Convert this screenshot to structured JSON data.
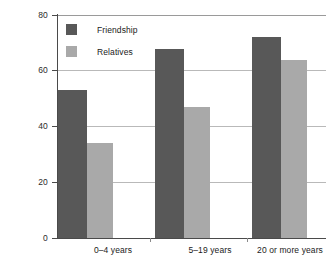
{
  "chart_data": {
    "type": "bar",
    "title": "",
    "subtitle": "",
    "xlabel": "",
    "ylabel": "",
    "ylim": [
      0,
      80
    ],
    "yticks": [
      0,
      20,
      40,
      60,
      80
    ],
    "ytick_labels": [
      "0",
      "20",
      "40",
      "60",
      "80"
    ],
    "grid": true,
    "legend_position": "top-left-inside",
    "categories": [
      "0–4 years",
      "5–19 years",
      "20 or more years"
    ],
    "series": [
      {
        "name": "Friendship",
        "color": "#585858",
        "values": [
          53,
          68,
          72
        ]
      },
      {
        "name": "Relatives",
        "color": "#a9a9a9",
        "values": [
          34,
          47,
          64
        ]
      }
    ]
  },
  "legend": {
    "items": [
      {
        "label": "Friendship",
        "swatch": "friendship-swatch"
      },
      {
        "label": "Relatives",
        "swatch": "relatives-swatch"
      }
    ]
  },
  "axes": {
    "y_tick_labels": [
      "80",
      "60",
      "40",
      "20",
      "0"
    ],
    "x_category_labels": [
      "0–4 years",
      "5–19 years",
      "20 or more years"
    ]
  },
  "colors": {
    "friendship": "#585858",
    "relatives": "#a9a9a9",
    "axis": "#4a4a4a",
    "gridline": "#b9b9b9",
    "background": "#ffffff",
    "text": "#1a1a1a"
  }
}
